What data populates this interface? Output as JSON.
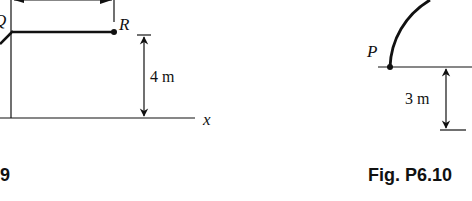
{
  "figures": [
    {
      "id": "left",
      "caption_visible": ".9",
      "labels": {
        "point_r": "R",
        "point_q_partial": "Q",
        "axis_x": "x",
        "height_dim": "4 m"
      }
    },
    {
      "id": "right",
      "caption": "Fig. P6.10",
      "labels": {
        "point_p": "P",
        "depth_dim": "3 m"
      }
    }
  ],
  "colors": {
    "ink": "#111111",
    "background": "#ffffff"
  }
}
